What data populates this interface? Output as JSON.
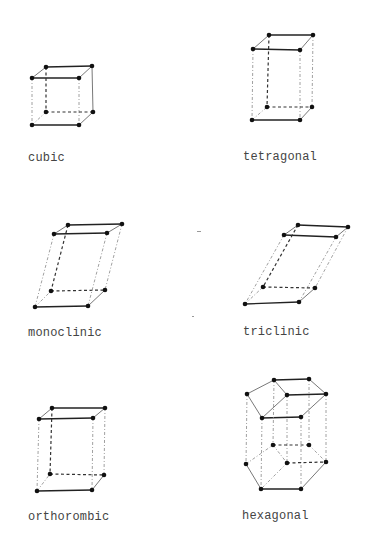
{
  "lattices": [
    {
      "id": "cubic",
      "label": "cubic",
      "label_pos": [
        28,
        151
      ],
      "vertices": {
        "tbl": [
          46,
          67
        ],
        "tbr": [
          92,
          66
        ],
        "tfl": [
          32,
          78
        ],
        "tfr": [
          79,
          78
        ],
        "bbl": [
          46,
          112
        ],
        "bbr": [
          93,
          112
        ],
        "bfl": [
          32,
          125
        ],
        "bfr": [
          79,
          125
        ]
      }
    },
    {
      "id": "tetragonal",
      "label": "tetragonal",
      "label_pos": [
        243,
        150
      ],
      "vertices": {
        "tbl": [
          269,
          35
        ],
        "tbr": [
          313,
          35
        ],
        "tfl": [
          253,
          49
        ],
        "tfr": [
          300,
          50
        ],
        "bbl": [
          267,
          107
        ],
        "bbr": [
          312,
          107
        ],
        "bfl": [
          252,
          120
        ],
        "bfr": [
          300,
          120
        ]
      }
    },
    {
      "id": "monoclinic",
      "label": "monoclinic",
      "label_pos": [
        28,
        326
      ],
      "vertices": {
        "tbl": [
          68,
          225
        ],
        "tbr": [
          122,
          224
        ],
        "tfl": [
          54,
          234
        ],
        "tfr": [
          107,
          233
        ],
        "bbl": [
          51,
          291
        ],
        "bbr": [
          105,
          290
        ],
        "bfl": [
          35,
          307
        ],
        "bfr": [
          88,
          306
        ]
      }
    },
    {
      "id": "triclinic",
      "label": "triclinic",
      "label_pos": [
        243,
        325
      ],
      "vertices": {
        "tbl": [
          298,
          225
        ],
        "tbr": [
          348,
          227
        ],
        "tfl": [
          284,
          235
        ],
        "tfr": [
          336,
          237
        ],
        "bbl": [
          263,
          287
        ],
        "bbr": [
          315,
          288
        ],
        "bfl": [
          245,
          304
        ],
        "bfr": [
          299,
          302
        ]
      }
    },
    {
      "id": "orthorhombic",
      "label": "orthorombic",
      "label_pos": [
        28,
        510
      ],
      "vertices": {
        "tbl": [
          52,
          408
        ],
        "tbr": [
          105,
          408
        ],
        "tfl": [
          39,
          419
        ],
        "tfr": [
          93,
          418
        ],
        "bbl": [
          50,
          474
        ],
        "bbr": [
          104,
          475
        ],
        "bfl": [
          37,
          491
        ],
        "bfr": [
          92,
          490
        ]
      }
    },
    {
      "id": "hexagonal",
      "label": "hexagonal",
      "label_pos": [
        242,
        509
      ],
      "top_hexagon": [
        [
          274,
          380
        ],
        [
          309,
          379
        ],
        [
          326,
          394
        ],
        [
          301,
          417
        ],
        [
          262,
          418
        ],
        [
          247,
          394
        ]
      ],
      "top_center": [
        287,
        395
      ],
      "bottom_hexagon": [
        [
          273,
          445
        ],
        [
          309,
          445
        ],
        [
          326,
          462
        ],
        [
          301,
          489
        ],
        [
          261,
          489
        ],
        [
          246,
          464
        ]
      ],
      "bottom_center": [
        287,
        463
      ]
    }
  ],
  "colors": {
    "ink": "#111111",
    "label": "#444444",
    "background": "#ffffff"
  }
}
